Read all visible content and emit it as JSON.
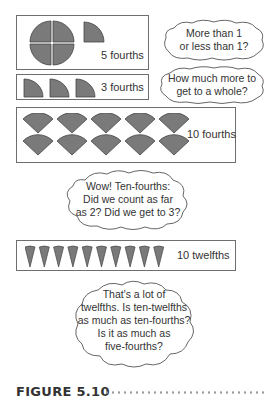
{
  "colors": {
    "shape_fill": "#7a7a7a",
    "shape_stroke": "#444444",
    "box_border": "#6e6e6e",
    "text": "#333333"
  },
  "diagram": {
    "rows": [
      {
        "label": "5 fourths",
        "pieces": 5,
        "unit": "fourths",
        "shape": "quarter-circle",
        "note": "one whole circle of 4 quarters plus 1 quarter"
      },
      {
        "label": "3 fourths",
        "pieces": 3,
        "unit": "fourths",
        "shape": "quarter-circle"
      },
      {
        "label": "10 fourths",
        "pieces": 10,
        "unit": "fourths",
        "shape": "quarter-circle-wedge",
        "arrangement": "2 rows of 5"
      },
      {
        "label": "10 twelfths",
        "pieces": 10,
        "unit": "twelfths",
        "shape": "twelfth-wedge"
      }
    ],
    "clouds": [
      {
        "lines": [
          "More than 1",
          "or less than 1?"
        ]
      },
      {
        "lines": [
          "How much more to",
          "get to a whole?"
        ]
      },
      {
        "lines": [
          "Wow! Ten-fourths:",
          "Did we count as far",
          "as 2? Did we get to 3?"
        ]
      },
      {
        "lines": [
          "That's a lot of",
          "twelfths. Is ten-twelfths",
          "as much as ten-fourths?",
          "Is it as much as",
          "five-fourths?"
        ]
      }
    ]
  },
  "caption": {
    "label": "FIGURE 5.10"
  }
}
